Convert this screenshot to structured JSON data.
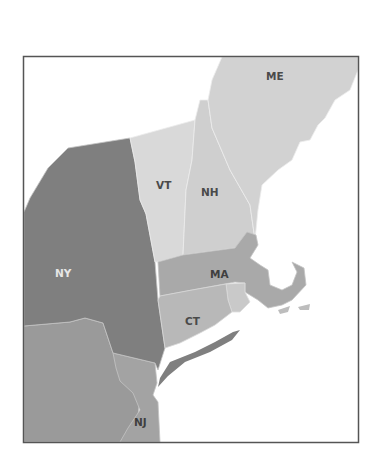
{
  "map": {
    "title": "",
    "states": [
      {
        "id": "ME",
        "label": "ME",
        "fill": "#d2d2d2",
        "label_color": "#4a4a4a"
      },
      {
        "id": "VT",
        "label": "VT",
        "fill": "#d9d9d9",
        "label_color": "#4a4a4a"
      },
      {
        "id": "NH",
        "label": "NH",
        "fill": "#cfcfcf",
        "label_color": "#4a4a4a"
      },
      {
        "id": "NY",
        "label": "NY",
        "fill": "#7f7f7f",
        "label_color": "#e6e6e6"
      },
      {
        "id": "MA",
        "label": "MA",
        "fill": "#a9a9a9",
        "label_color": "#3f3f3f"
      },
      {
        "id": "CT",
        "label": "CT",
        "fill": "#b8b8b8",
        "label_color": "#4a4a4a"
      },
      {
        "id": "RI",
        "label": "",
        "fill": "#c9c9c9",
        "label_color": "#4a4a4a"
      },
      {
        "id": "NJ",
        "label": "NJ",
        "fill": "#a3a3a3",
        "label_color": "#3f3f3f"
      },
      {
        "id": "PA",
        "label": "",
        "fill": "#9a9a9a",
        "label_color": "#3f3f3f"
      }
    ],
    "frame_color": "#555555",
    "background": "#ffffff"
  }
}
